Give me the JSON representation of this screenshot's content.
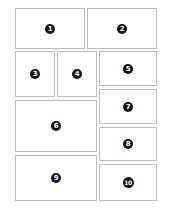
{
  "layout": {
    "border_color": "#bdbdbd",
    "badge_color": "#111111",
    "badge_text_color": "#ffffff"
  },
  "panels": [
    {
      "id": 1,
      "label": "1",
      "x": 15,
      "y": 8,
      "w": 70,
      "h": 41
    },
    {
      "id": 2,
      "label": "2",
      "x": 87,
      "y": 8,
      "w": 70,
      "h": 41
    },
    {
      "id": 3,
      "label": "3",
      "x": 15,
      "y": 51,
      "w": 40,
      "h": 46
    },
    {
      "id": 4,
      "label": "4",
      "x": 57,
      "y": 51,
      "w": 40,
      "h": 46
    },
    {
      "id": 5,
      "label": "5",
      "x": 99,
      "y": 51,
      "w": 58,
      "h": 35
    },
    {
      "id": 6,
      "label": "6",
      "x": 15,
      "y": 100,
      "w": 82,
      "h": 52
    },
    {
      "id": 7,
      "label": "7",
      "x": 99,
      "y": 89,
      "w": 58,
      "h": 35
    },
    {
      "id": 8,
      "label": "8",
      "x": 99,
      "y": 127,
      "w": 58,
      "h": 34
    },
    {
      "id": 9,
      "label": "9",
      "x": 15,
      "y": 155,
      "w": 82,
      "h": 46
    },
    {
      "id": 10,
      "label": "10",
      "x": 99,
      "y": 164,
      "w": 58,
      "h": 37
    }
  ]
}
